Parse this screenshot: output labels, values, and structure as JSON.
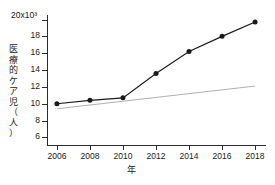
{
  "chart_data": {
    "type": "line",
    "title": "",
    "xlabel": "年",
    "ylabel": "医療的ケア児（人）",
    "y_exponent_label": "20x10³",
    "categories": [
      2006,
      2008,
      2010,
      2012,
      2014,
      2016,
      2018
    ],
    "x": [
      2006,
      2008,
      2010,
      2012,
      2014,
      2016,
      2018
    ],
    "xlim": [
      2005.4,
      2018.6
    ],
    "ylim": [
      5.1,
      20.3
    ],
    "xticks": [
      2006,
      2008,
      2010,
      2012,
      2014,
      2016,
      2018
    ],
    "xtick_labels": [
      "2006",
      "2008",
      "2010",
      "2012",
      "2014",
      "2016",
      "2018"
    ],
    "yticks": [
      20,
      18,
      16,
      14,
      12,
      10,
      8,
      6
    ],
    "ytick_labels": [
      "20x10³",
      "18",
      "16",
      "14",
      "12",
      "10",
      "8",
      "6"
    ],
    "grid": false,
    "legend": false,
    "series": [
      {
        "name": "医療的ケア児",
        "style": "line-with-markers",
        "color": "#1a1a1a",
        "marker": "filled-circle",
        "values": [
          10.0,
          10.4,
          10.7,
          13.6,
          16.2,
          18.0,
          19.7
        ]
      },
      {
        "name": "trend-line",
        "style": "thin-line",
        "color": "#9a9a9a",
        "marker": "none",
        "x": [
          2006,
          2018
        ],
        "values": [
          9.4,
          12.1
        ]
      }
    ],
    "ylabel_chars": [
      "医",
      "療",
      "的",
      "ケ",
      "ア",
      "児",
      "（",
      "人",
      "）"
    ],
    "units_note": "人",
    "annotations": []
  }
}
